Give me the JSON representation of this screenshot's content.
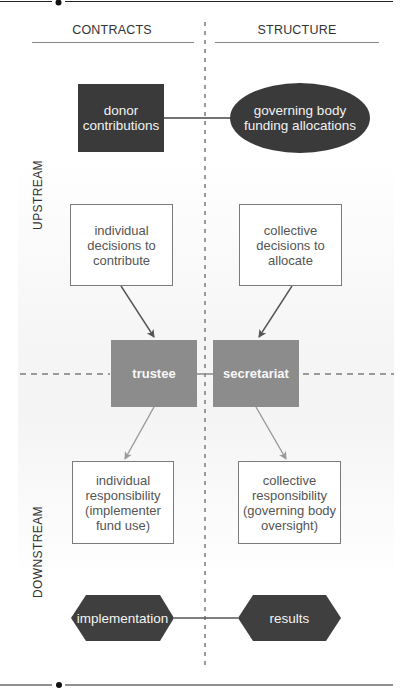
{
  "columns": {
    "left": "CONTRACTS",
    "right": "STRUCTURE"
  },
  "rows": {
    "upper": "UPSTREAM",
    "lower": "DOWNSTREAM"
  },
  "nodes": {
    "donor_contributions": "donor\ncontributions",
    "governing_body_funding": "governing body\nfunding allocations",
    "individual_decisions": "individual\ndecisions to\ncontribute",
    "collective_decisions": "collective\ndecisions to\nallocate",
    "trustee": "trustee",
    "secretariat": "secretariat",
    "individual_responsibility": "individual\nresponsibility\n(implementer\nfund use)",
    "collective_responsibility": "collective\nresponsibility\n(governing body\noversight)",
    "implementation": "implementation",
    "results": "results"
  },
  "colors": {
    "dark_node": "#3a3a3a",
    "mid_node": "#8c8c8c",
    "outline": "#7b7b7b",
    "divider": "#9a9a9a",
    "arrow_dark": "#555555",
    "arrow_light": "#9a9a9a"
  }
}
